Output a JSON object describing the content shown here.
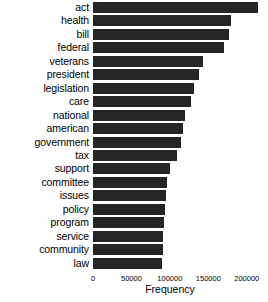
{
  "chart_data": {
    "type": "bar",
    "orientation": "horizontal",
    "title": "",
    "xlabel": "Frequency",
    "ylabel": "",
    "xlim": [
      0,
      225000
    ],
    "xticks": [
      0,
      50000,
      100000,
      150000,
      200000
    ],
    "xtick_labels": [
      "0",
      "50000",
      "100000",
      "150000",
      "200000"
    ],
    "grid": false,
    "legend": null,
    "bar_color": "#252525",
    "background_color": "#ffffff",
    "categories": [
      "act",
      "health",
      "bill",
      "federal",
      "veterans",
      "president",
      "legislation",
      "care",
      "national",
      "american",
      "government",
      "tax",
      "support",
      "committee",
      "issues",
      "policy",
      "program",
      "service",
      "community",
      "law"
    ],
    "values": [
      214000,
      180000,
      177000,
      170000,
      143000,
      138000,
      132000,
      127000,
      120000,
      117000,
      114000,
      109000,
      100000,
      96000,
      95000,
      93000,
      92000,
      91000,
      91000,
      90000
    ]
  }
}
